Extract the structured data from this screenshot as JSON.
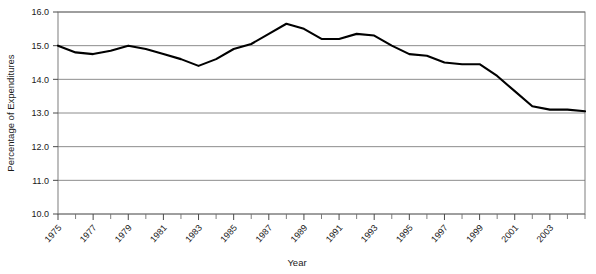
{
  "chart_data": {
    "type": "line",
    "title": "",
    "xlabel": "Year",
    "ylabel": "Percentage of Expenditures",
    "xlim": [
      1975,
      2005
    ],
    "ylim": [
      10.0,
      16.0
    ],
    "grid": true,
    "legend": null,
    "y_ticks": [
      "16.0",
      "15.0",
      "14.0",
      "13.0",
      "12.0",
      "11.0",
      "10.0"
    ],
    "y_tick_values": [
      16.0,
      15.0,
      14.0,
      13.0,
      12.0,
      11.0,
      10.0
    ],
    "x_tick_labels": [
      "1975",
      "1977",
      "1979",
      "1981",
      "1983",
      "1985",
      "1987",
      "1989",
      "1991",
      "1993",
      "1995",
      "1997",
      "1999",
      "2001",
      "2003"
    ],
    "x_tick_values": [
      1975,
      1976,
      1977,
      1978,
      1979,
      1980,
      1981,
      1982,
      1983,
      1984,
      1985,
      1986,
      1987,
      1988,
      1989,
      1990,
      1991,
      1992,
      1993,
      1994,
      1995,
      1996,
      1997,
      1998,
      1999,
      2000,
      2001,
      2002,
      2003,
      2004,
      2005
    ],
    "x": [
      1975,
      1976,
      1977,
      1978,
      1979,
      1980,
      1981,
      1982,
      1983,
      1984,
      1985,
      1986,
      1987,
      1988,
      1989,
      1990,
      1991,
      1992,
      1993,
      1994,
      1995,
      1996,
      1997,
      1998,
      1999,
      2000,
      2001,
      2002,
      2003,
      2004,
      2005
    ],
    "values": [
      15.0,
      14.8,
      14.75,
      14.85,
      15.0,
      14.9,
      14.75,
      14.6,
      14.4,
      14.6,
      14.9,
      15.05,
      15.35,
      15.65,
      15.5,
      15.2,
      15.2,
      15.35,
      15.3,
      15.0,
      14.75,
      14.7,
      14.5,
      14.45,
      14.45,
      14.1,
      13.65,
      13.2,
      13.1,
      13.1,
      13.05
    ],
    "series": [
      {
        "name": "Percentage of Expenditures",
        "color": "#000000",
        "values": [
          15.0,
          14.8,
          14.75,
          14.85,
          15.0,
          14.9,
          14.75,
          14.6,
          14.4,
          14.6,
          14.9,
          15.05,
          15.35,
          15.65,
          15.5,
          15.2,
          15.2,
          15.35,
          15.3,
          15.0,
          14.75,
          14.7,
          14.5,
          14.45,
          14.45,
          14.1,
          13.65,
          13.2,
          13.1,
          13.1,
          13.05
        ]
      }
    ]
  },
  "plot_geometry": {
    "left": 58,
    "right": 585,
    "top": 12,
    "bottom": 214
  },
  "style": {
    "line_color": "#000000",
    "grid_color": "#6f6f6f",
    "text_color": "#1a1a1a",
    "background": "#ffffff"
  }
}
